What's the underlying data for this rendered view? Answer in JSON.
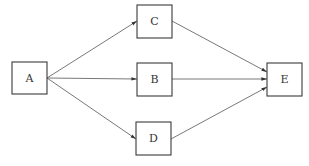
{
  "diagram": {
    "type": "directed-graph",
    "nodes": [
      {
        "id": "A",
        "label": "A",
        "x": 12,
        "y": 62,
        "w": 35,
        "h": 32
      },
      {
        "id": "C",
        "label": "C",
        "x": 137,
        "y": 5,
        "w": 35,
        "h": 33
      },
      {
        "id": "B",
        "label": "B",
        "x": 137,
        "y": 63,
        "w": 35,
        "h": 33
      },
      {
        "id": "D",
        "label": "D",
        "x": 136,
        "y": 122,
        "w": 35,
        "h": 33
      },
      {
        "id": "E",
        "label": "E",
        "x": 267,
        "y": 63,
        "w": 35,
        "h": 33
      }
    ],
    "edges": [
      {
        "from": "A",
        "to": "C"
      },
      {
        "from": "A",
        "to": "B"
      },
      {
        "from": "A",
        "to": "D"
      },
      {
        "from": "C",
        "to": "E"
      },
      {
        "from": "B",
        "to": "E"
      },
      {
        "from": "D",
        "to": "E"
      }
    ],
    "colors": {
      "stroke": "#3a3a3a",
      "edge": "#555555",
      "text": "#333333",
      "background": "#ffffff"
    }
  }
}
